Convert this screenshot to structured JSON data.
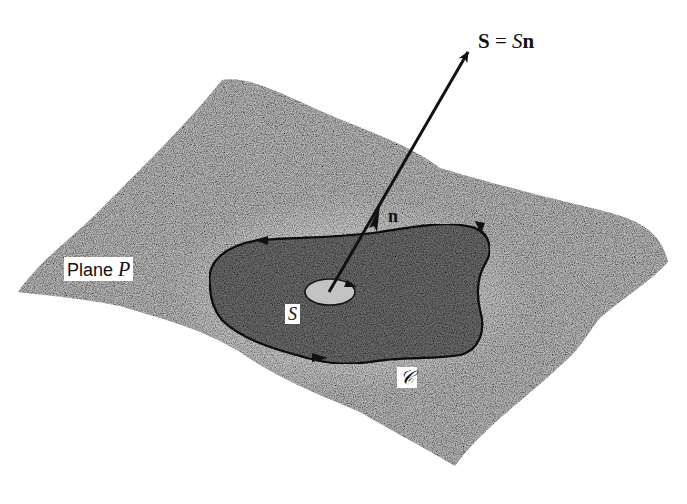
{
  "figure": {
    "plane_label": {
      "text": "Plane ",
      "symbol": "P"
    },
    "surface_label": "S",
    "normal_label": "n",
    "curve_label": "𝒞",
    "vector_equation": {
      "lhs": "S",
      "equals": " = ",
      "scalar": "S",
      "unit": "n"
    }
  },
  "colors": {
    "background": "#ffffff",
    "plane_fill": "#bcbcbc",
    "region_fill": "#6a6a6a",
    "ink": "#111111"
  }
}
